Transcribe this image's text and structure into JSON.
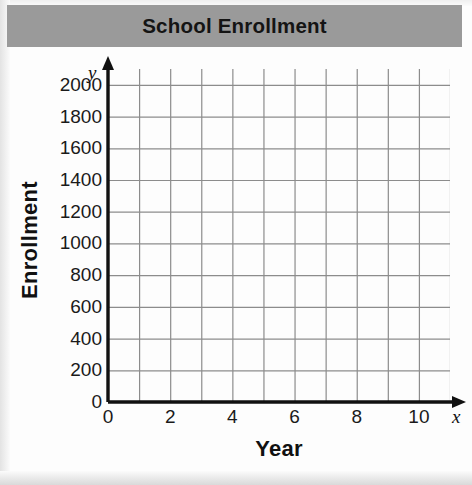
{
  "chart_data": {
    "type": "line",
    "title": "School Enrollment",
    "xlabel": "Year",
    "ylabel": "Enrollment",
    "x_axis_letter": "x",
    "y_axis_letter": "y",
    "xlim": [
      0,
      11
    ],
    "ylim": [
      0,
      2100
    ],
    "x_tick_labels": [
      "0",
      "2",
      "4",
      "6",
      "8",
      "10"
    ],
    "x_tick_values": [
      0,
      2,
      4,
      6,
      8,
      10
    ],
    "x_gridline_step": 1,
    "y_tick_labels": [
      "0",
      "200",
      "400",
      "600",
      "800",
      "1000",
      "1200",
      "1400",
      "1600",
      "1800",
      "2000"
    ],
    "y_tick_values": [
      0,
      200,
      400,
      600,
      800,
      1000,
      1200,
      1400,
      1600,
      1800,
      2000
    ],
    "y_gridline_step": 200,
    "grid": true,
    "legend": null,
    "series": [],
    "values": [],
    "categories": [],
    "annotations": [],
    "note": "Empty coordinate grid — no data plotted"
  },
  "style": {
    "title_band_color": "#9a9a9a",
    "grid_line_color": "#8c8c8c",
    "axis_line_color": "#111111",
    "background_color": "#fdfdfd",
    "text_color": "#1a1a1a"
  }
}
